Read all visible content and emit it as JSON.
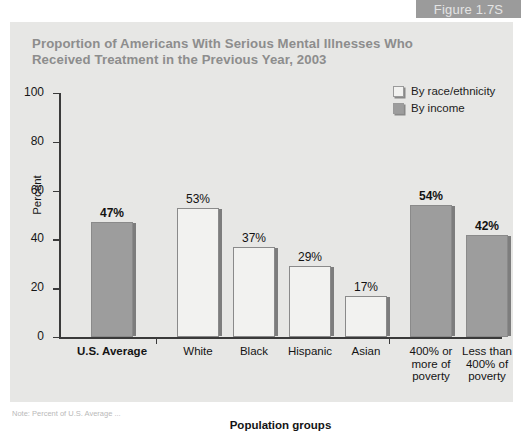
{
  "figure_tab": {
    "label": "Figure 1.7S"
  },
  "chart_panel": {
    "title": "Proportion of Americans With Serious Mental Illnesses Who\nReceived Treatment in the Previous Year, 2003"
  },
  "legend": {
    "position": "top-right",
    "items": [
      {
        "label": "By race/ethnicity",
        "swatch": "race",
        "color": "#f2f2f0"
      },
      {
        "label": "By income",
        "swatch": "income",
        "color": "#9d9d9d"
      }
    ]
  },
  "footnote": {
    "text": "Note: Percent of U.S. Average ..."
  },
  "chart_data": {
    "type": "bar",
    "title": "Proportion of Americans With Serious Mental Illnesses Who Received Treatment in the Previous Year, 2003",
    "xlabel": "Population groups",
    "ylabel": "Percent",
    "ylim": [
      0,
      100
    ],
    "yticks": [
      0,
      20,
      40,
      60,
      80,
      100
    ],
    "ytick_labels": [
      "0",
      "20",
      "40",
      "60",
      "80",
      "100"
    ],
    "grid": false,
    "legend_position": "top-right",
    "value_suffix": "%",
    "categories": [
      "U.S. Average",
      "White",
      "Black",
      "Hispanic",
      "Asian",
      "400% or\nmore of\npoverty",
      "Less than\n400% of\npoverty"
    ],
    "values": [
      47,
      53,
      37,
      29,
      17,
      54,
      42
    ],
    "value_labels": [
      "47%",
      "53%",
      "37%",
      "29%",
      "17%",
      "54%",
      "42%"
    ],
    "series_of_bar": [
      "income",
      "race",
      "race",
      "race",
      "race",
      "income",
      "income"
    ],
    "groups": [
      {
        "name": "Overall",
        "categories": [
          "U.S. Average"
        ]
      },
      {
        "name": "By race/ethnicity",
        "categories": [
          "White",
          "Black",
          "Hispanic",
          "Asian"
        ]
      },
      {
        "name": "By income",
        "categories": [
          "400% or more of poverty",
          "Less than 400% of poverty"
        ]
      }
    ],
    "colors": {
      "race": "#f2f2f0",
      "income": "#9d9d9d",
      "panel": "#e7e7e5",
      "axis": "#3a3a3a"
    }
  }
}
